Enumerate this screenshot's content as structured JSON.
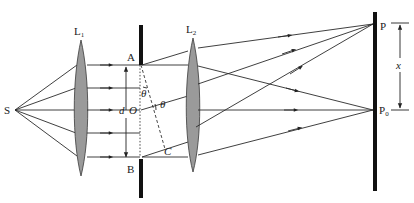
{
  "figure": {
    "type": "optics-diagram",
    "labels": {
      "source": "S",
      "lens1": "L",
      "lens1_sub": "1",
      "lens2": "L",
      "lens2_sub": "2",
      "slit_top": "A",
      "slit_bottom": "B",
      "slit_separation": "d",
      "center": "O",
      "angle_upper": "θ",
      "angle_lower": "θ",
      "path_point": "C",
      "screen_point_top": "P",
      "screen_center": "P",
      "screen_center_sub": "0",
      "distance": "x"
    },
    "colors": {
      "lens_fill": "#9a9a9a",
      "barrier": "#111111",
      "line": "#2a2a2a",
      "background": "#ffffff"
    }
  }
}
